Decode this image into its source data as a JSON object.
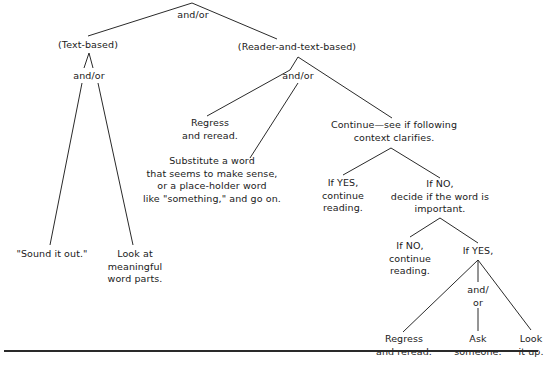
{
  "diagram": {
    "type": "decision-tree",
    "topic": "Strategies for dealing with an unknown word",
    "root": {
      "connector": "and/or",
      "children": [
        {
          "label": "(Text-based)",
          "connector": "and/or",
          "children": [
            {
              "label": "\"Sound it out.\""
            },
            {
              "label": "Look at meaningful word parts."
            }
          ]
        },
        {
          "label": "(Reader-and-text-based)",
          "connector": "and/or",
          "children": [
            {
              "label": "Regress and reread."
            },
            {
              "label": "Substitute a word that seems to make sense, or a place-holder word like \"something,\" and go on."
            },
            {
              "label": "Continue—see if following context clarifies.",
              "children": [
                {
                  "label": "If YES, continue reading."
                },
                {
                  "label": "If NO, decide if the word is important.",
                  "children": [
                    {
                      "label": "If NO, continue reading."
                    },
                    {
                      "label": "If YES,",
                      "connector": "and/or",
                      "children": [
                        {
                          "label": "Regress and reread."
                        },
                        {
                          "label": "Ask someone."
                        },
                        {
                          "label": "Look it up."
                        }
                      ]
                    }
                  ]
                }
              ]
            }
          ]
        }
      ]
    }
  },
  "labels": {
    "root_connector": "and/or",
    "text_based": "(Text-based)",
    "text_based_connector": "and/or",
    "sound_it_out": "\"Sound it out.\"",
    "word_parts": [
      "Look at",
      "meaningful",
      "word parts."
    ],
    "reader_text_based": "(Reader-and-text-based)",
    "reader_text_connector": "and/or",
    "regress_1": [
      "Regress",
      "and reread."
    ],
    "substitute": [
      "Substitute a word",
      "that seems to make sense,",
      "or a place-holder word",
      "like \"something,\" and go on."
    ],
    "continue": [
      "Continue—see if following",
      "context clarifies."
    ],
    "yes_continue": [
      "If YES,",
      "continue",
      "reading."
    ],
    "no_decide": [
      "If NO,",
      "decide if the word is",
      "important."
    ],
    "no_continue": [
      "If NO,",
      "continue",
      "reading."
    ],
    "yes_important": "If YES,",
    "final_connector": [
      "and/",
      "or"
    ],
    "regress_2": [
      "Regress",
      "and reread."
    ],
    "ask": [
      "Ask",
      "someone."
    ],
    "look_up": [
      "Look",
      "it up."
    ]
  }
}
